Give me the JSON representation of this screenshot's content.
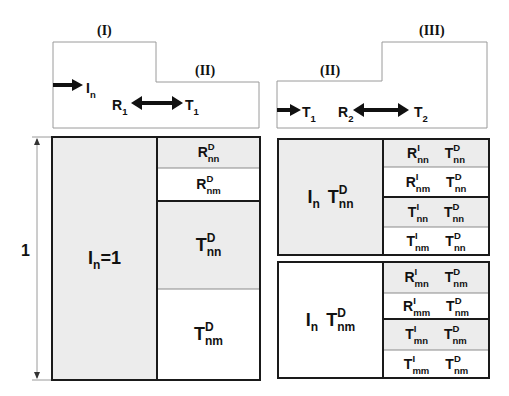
{
  "top_left_diagram": {
    "region_labels": [
      "(I)",
      "(II)"
    ],
    "incident": {
      "base": "I",
      "sub": "n"
    },
    "reflected": {
      "base": "R",
      "sub": "1"
    },
    "transmitted": {
      "base": "T",
      "sub": "1"
    }
  },
  "top_right_diagram": {
    "region_labels": [
      "(II)",
      "(III)"
    ],
    "incident": {
      "base": "T",
      "sub": "1"
    },
    "reflected": {
      "base": "R",
      "sub": "2"
    },
    "transmitted": {
      "base": "T",
      "sub": "2"
    }
  },
  "dimension": {
    "label": "1"
  },
  "left_block": {
    "main": {
      "base": "I",
      "sub": "n",
      "suffix": "=1"
    },
    "cells": [
      {
        "base": "R",
        "sup": "D",
        "sub": "nn",
        "shaded": true
      },
      {
        "base": "R",
        "sup": "D",
        "sub": "nm",
        "shaded": false
      },
      {
        "base": "T",
        "sup": "D",
        "sub": "nn",
        "shaded": true
      },
      {
        "base": "T",
        "sup": "D",
        "sub": "nm",
        "shaded": false
      }
    ]
  },
  "right_top_block": {
    "main": [
      {
        "base": "I",
        "sub": "n",
        "sup": ""
      },
      {
        "base": "T",
        "sup": "D",
        "sub": "nn"
      }
    ],
    "cells": [
      {
        "a": {
          "base": "R",
          "sup": "I",
          "sub": "nn"
        },
        "b": {
          "base": "T",
          "sup": "D",
          "sub": "nn"
        },
        "shaded": true
      },
      {
        "a": {
          "base": "R",
          "sup": "I",
          "sub": "nm"
        },
        "b": {
          "base": "T",
          "sup": "D",
          "sub": "nn"
        },
        "shaded": false
      },
      {
        "a": {
          "base": "T",
          "sup": "I",
          "sub": "nn"
        },
        "b": {
          "base": "T",
          "sup": "D",
          "sub": "nn"
        },
        "shaded": true
      },
      {
        "a": {
          "base": "T",
          "sup": "I",
          "sub": "nm"
        },
        "b": {
          "base": "T",
          "sup": "D",
          "sub": "nn"
        },
        "shaded": false
      }
    ]
  },
  "right_bottom_block": {
    "main": [
      {
        "base": "I",
        "sub": "n",
        "sup": ""
      },
      {
        "base": "T",
        "sup": "D",
        "sub": "nm"
      }
    ],
    "cells": [
      {
        "a": {
          "base": "R",
          "sup": "I",
          "sub": "mn"
        },
        "b": {
          "base": "T",
          "sup": "D",
          "sub": "nm"
        },
        "shaded": true
      },
      {
        "a": {
          "base": "R",
          "sup": "I",
          "sub": "mm"
        },
        "b": {
          "base": "T",
          "sup": "D",
          "sub": "nm"
        },
        "shaded": false
      },
      {
        "a": {
          "base": "T",
          "sup": "I",
          "sub": "mn"
        },
        "b": {
          "base": "T",
          "sup": "D",
          "sub": "nm"
        },
        "shaded": true
      },
      {
        "a": {
          "base": "T",
          "sup": "I",
          "sub": "mm"
        },
        "b": {
          "base": "T",
          "sup": "D",
          "sub": "nm"
        },
        "shaded": false
      }
    ]
  },
  "colors": {
    "shade": "#ececec",
    "line": "#1a1a1a",
    "thin": "#8a8a8a",
    "outline": "#9a9a9a"
  }
}
